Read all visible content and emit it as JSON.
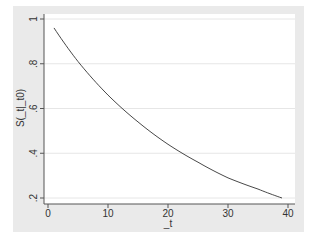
{
  "chart_data": {
    "type": "line",
    "title": "",
    "xlabel": "_t",
    "ylabel": "S(_t|_t0)",
    "xlim": [
      0,
      40
    ],
    "ylim": [
      0.2,
      1
    ],
    "xticks": [
      0,
      10,
      20,
      30,
      40
    ],
    "yticks": [
      0.2,
      0.4,
      0.6,
      0.8,
      1
    ],
    "xtick_labels": [
      "0",
      "10",
      "20",
      "30",
      "40"
    ],
    "ytick_labels": [
      ".2",
      ".4",
      ".6",
      ".8",
      "1"
    ],
    "grid": "horizontal",
    "legend": null,
    "series": [
      {
        "name": "S(_t|_t0)",
        "x": [
          1,
          5,
          10,
          15,
          20,
          25,
          30,
          35,
          39
        ],
        "y": [
          0.96,
          0.81,
          0.66,
          0.54,
          0.44,
          0.36,
          0.29,
          0.24,
          0.2
        ]
      }
    ]
  },
  "colors": {
    "background": "#eaeaea",
    "plot_area": "#ffffff",
    "line": "#333333",
    "grid": "#e6e6e6"
  }
}
